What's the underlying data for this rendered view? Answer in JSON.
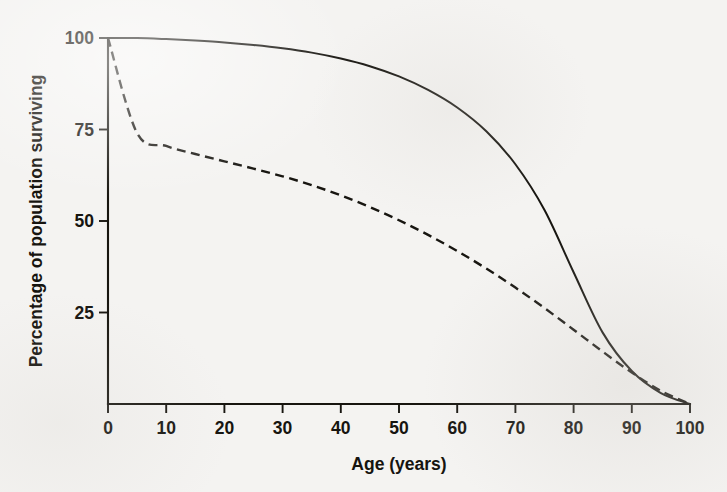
{
  "chart_data": {
    "type": "line",
    "title": "",
    "xlabel": "Age (years)",
    "ylabel": "Percentage of population surviving",
    "xlim": [
      0,
      100
    ],
    "ylim": [
      0,
      100
    ],
    "xticks": [
      0,
      10,
      20,
      30,
      40,
      50,
      60,
      70,
      80,
      90,
      100
    ],
    "xtick_labels": [
      "0",
      "10",
      "20",
      "30",
      "40",
      "50",
      "60",
      "70",
      "80",
      "90",
      "100"
    ],
    "yticks": [
      25,
      50,
      75,
      100
    ],
    "ytick_labels": [
      "25",
      "50",
      "75",
      "100"
    ],
    "grid": false,
    "legend": "none",
    "x": [
      0,
      5,
      10,
      15,
      20,
      25,
      30,
      35,
      40,
      45,
      50,
      55,
      60,
      65,
      70,
      75,
      80,
      85,
      90,
      95,
      100
    ],
    "series": [
      {
        "name": "solid-curve",
        "style": "solid",
        "color": "#171510",
        "values": [
          100,
          100,
          99.7,
          99.3,
          98.8,
          98.1,
          97.2,
          96.0,
          94.4,
          92.3,
          89.5,
          85.8,
          81.0,
          74.5,
          65.5,
          53.0,
          36.0,
          19.5,
          9.0,
          3.0,
          0
        ]
      },
      {
        "name": "dashed-curve",
        "style": "dashed",
        "color": "#171510",
        "values": [
          100,
          74.0,
          70.5,
          68.3,
          66.3,
          64.3,
          62.2,
          59.8,
          57.0,
          53.8,
          50.2,
          46.2,
          41.8,
          37.0,
          31.8,
          26.2,
          20.3,
          14.3,
          8.6,
          3.6,
          0
        ]
      }
    ]
  },
  "axes": {
    "y_axis_label": "Percentage of population surviving",
    "x_axis_label": "Age (years)"
  }
}
